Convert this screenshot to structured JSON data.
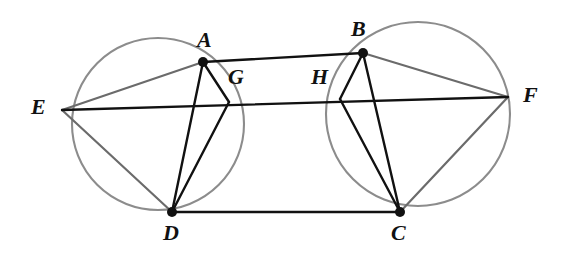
{
  "figure": {
    "width": 570,
    "height": 262,
    "background_color": "#ffffff",
    "stroke_colors": {
      "circle_gray": "#8c8c8c",
      "chord_gray": "#6b6b6b",
      "line_black": "#111111",
      "vertex_dot": "#111111"
    }
  },
  "points": [
    {
      "id": "A",
      "label": "A",
      "x": 203,
      "y": 62,
      "dot": true,
      "label_x": 197,
      "label_y": 29
    },
    {
      "id": "B",
      "label": "B",
      "x": 363,
      "y": 53,
      "dot": true,
      "label_x": 351,
      "label_y": 18
    },
    {
      "id": "C",
      "label": "C",
      "x": 400,
      "y": 212,
      "dot": true,
      "label_x": 391,
      "label_y": 222
    },
    {
      "id": "D",
      "label": "D",
      "x": 172,
      "y": 212,
      "dot": true,
      "label_x": 163,
      "label_y": 222
    },
    {
      "id": "E",
      "label": "E",
      "x": 62,
      "y": 110,
      "dot": false,
      "label_x": 31,
      "label_y": 96
    },
    {
      "id": "F",
      "label": "F",
      "x": 508,
      "y": 97,
      "dot": false,
      "label_x": 523,
      "label_y": 84
    },
    {
      "id": "G",
      "label": "G",
      "x": 229,
      "y": 102,
      "dot": false,
      "label_x": 228,
      "label_y": 66
    },
    {
      "id": "H",
      "label": "H",
      "x": 340,
      "y": 99,
      "dot": false,
      "label_x": 311,
      "label_y": 66
    }
  ],
  "circles": [
    {
      "id": "left-circle",
      "cx": 158,
      "cy": 124,
      "r": 86,
      "stroke": "#8c8c8c",
      "stroke_width": 2.1
    },
    {
      "id": "right-circle",
      "cx": 418,
      "cy": 114,
      "r": 92,
      "stroke": "#8c8c8c",
      "stroke_width": 2.1
    }
  ],
  "segments": [
    {
      "id": "AB",
      "from": "A",
      "to": "B",
      "style": "black",
      "name": "segment-ab"
    },
    {
      "id": "DC",
      "from": "D",
      "to": "C",
      "style": "black",
      "name": "segment-dc"
    },
    {
      "id": "AD",
      "from": "A",
      "to": "D",
      "style": "black",
      "name": "segment-ad"
    },
    {
      "id": "BC",
      "from": "B",
      "to": "C",
      "style": "black",
      "name": "segment-bc"
    },
    {
      "id": "EF",
      "from": "E",
      "to": "F",
      "style": "black",
      "name": "segment-ef"
    },
    {
      "id": "EA",
      "from": "E",
      "to": "A",
      "style": "gray-chord",
      "name": "segment-ea"
    },
    {
      "id": "ED",
      "from": "E",
      "to": "D",
      "style": "gray-chord",
      "name": "segment-ed"
    },
    {
      "id": "FB",
      "from": "F",
      "to": "B",
      "style": "gray-chord",
      "name": "segment-fb"
    },
    {
      "id": "FC",
      "from": "F",
      "to": "C",
      "style": "gray-chord",
      "name": "segment-fc"
    },
    {
      "id": "AG",
      "from": "A",
      "to": "G",
      "style": "black",
      "name": "segment-ag"
    },
    {
      "id": "GD",
      "from": "G",
      "to": "D",
      "style": "black",
      "name": "segment-gd"
    },
    {
      "id": "BH",
      "from": "B",
      "to": "H",
      "style": "black",
      "name": "segment-bh"
    },
    {
      "id": "HC",
      "from": "H",
      "to": "C",
      "style": "black",
      "name": "segment-hc"
    }
  ],
  "labels": {
    "A": "A",
    "B": "B",
    "C": "C",
    "D": "D",
    "E": "E",
    "F": "F",
    "G": "G",
    "H": "H"
  }
}
